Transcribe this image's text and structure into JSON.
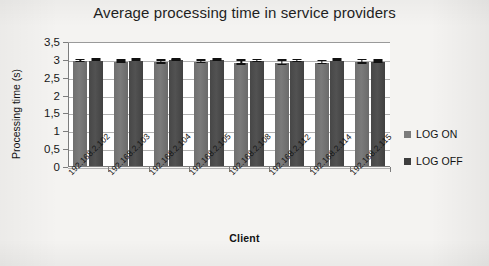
{
  "chart_data": {
    "type": "bar",
    "title": "Average processing time in service providers",
    "xlabel": "Client",
    "ylabel": "Processing time (s)",
    "ylim": [
      0,
      3.5
    ],
    "yticks": [
      0,
      0.5,
      1,
      1.5,
      2,
      2.5,
      3,
      3.5
    ],
    "ytick_labels": [
      "0",
      "0,5",
      "1",
      "1,5",
      "2",
      "2,5",
      "3",
      "3,5"
    ],
    "grid": true,
    "legend_position": "right",
    "decimal_separator": ",",
    "categories": [
      "192.168.2.102",
      "192.168.2.103",
      "192.168.2.104",
      "192.168.2.105",
      "192.168.2.108",
      "192.168.2.112",
      "192.168.2.114",
      "192.168.2.115"
    ],
    "series": [
      {
        "name": "LOG ON",
        "color": "#7b7b7b",
        "values": [
          2.96,
          2.95,
          2.93,
          2.94,
          2.92,
          2.91,
          2.92,
          2.94
        ],
        "errors": [
          0.03,
          0.03,
          0.04,
          0.04,
          0.05,
          0.06,
          0.04,
          0.05
        ]
      },
      {
        "name": "LOG OFF",
        "color": "#3d3d3d",
        "values": [
          2.98,
          2.98,
          2.99,
          3.0,
          2.96,
          2.96,
          2.98,
          2.95
        ],
        "errors": [
          0.02,
          0.02,
          0.02,
          0.02,
          0.03,
          0.03,
          0.02,
          0.03
        ]
      }
    ]
  },
  "legend": {
    "items": [
      {
        "label": "LOG ON",
        "swatch": "legend-swatch-log-on"
      },
      {
        "label": "LOG OFF",
        "swatch": "legend-swatch-log-off"
      }
    ]
  }
}
